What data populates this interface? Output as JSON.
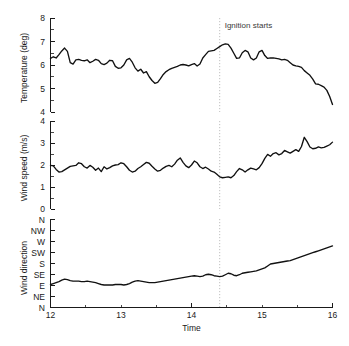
{
  "figure": {
    "annotation": {
      "text": "Ignition starts",
      "x_value": 14.4,
      "color": "#b9b9b9"
    },
    "line_color": "#111111",
    "xlabel": "Time",
    "x_ticks": [
      "12",
      "13",
      "14",
      "15",
      "16"
    ],
    "x_minor_ticks": [
      "12.5",
      "13.5",
      "14.5",
      "15.5"
    ]
  },
  "chart_data": [
    {
      "type": "line",
      "title": "",
      "xlabel": "",
      "ylabel": "Temperature (deg)",
      "xlim": [
        12,
        16
      ],
      "ylim": [
        4,
        8
      ],
      "yticks": [
        4,
        5,
        6,
        7,
        8
      ],
      "ytick_labels": [
        "4",
        "5",
        "6",
        "7",
        "8"
      ],
      "grid": false,
      "legend": "none",
      "annotations": [
        {
          "text": "Ignition starts",
          "x": 14.4
        }
      ],
      "x": [
        12.0,
        12.04,
        12.08,
        12.12,
        12.16,
        12.2,
        12.24,
        12.28,
        12.32,
        12.36,
        12.4,
        12.44,
        12.48,
        12.52,
        12.56,
        12.6,
        12.64,
        12.68,
        12.72,
        12.76,
        12.8,
        12.84,
        12.88,
        12.92,
        12.96,
        13.0,
        13.04,
        13.08,
        13.12,
        13.16,
        13.2,
        13.24,
        13.28,
        13.32,
        13.36,
        13.4,
        13.44,
        13.48,
        13.52,
        13.56,
        13.6,
        13.64,
        13.68,
        13.72,
        13.76,
        13.8,
        13.84,
        13.88,
        13.92,
        13.96,
        14.0,
        14.04,
        14.08,
        14.12,
        14.16,
        14.2,
        14.24,
        14.28,
        14.32,
        14.36,
        14.4,
        14.44,
        14.48,
        14.52,
        14.56,
        14.6,
        14.64,
        14.68,
        14.72,
        14.76,
        14.8,
        14.84,
        14.88,
        14.92,
        14.96,
        15.0,
        15.04,
        15.08,
        15.12,
        15.16,
        15.2,
        15.24,
        15.28,
        15.32,
        15.36,
        15.4,
        15.44,
        15.48,
        15.52,
        15.56,
        15.6,
        15.64,
        15.68,
        15.72,
        15.76,
        15.8,
        15.84,
        15.88,
        15.92,
        15.96,
        16.0
      ],
      "y": [
        6.28,
        6.35,
        6.3,
        6.44,
        6.6,
        6.72,
        6.58,
        6.1,
        6.04,
        6.22,
        6.24,
        6.2,
        6.18,
        6.22,
        6.1,
        6.16,
        6.24,
        6.2,
        6.06,
        6.02,
        6.08,
        6.2,
        6.18,
        5.94,
        5.86,
        5.88,
        6.0,
        6.22,
        6.28,
        6.12,
        5.88,
        5.74,
        5.82,
        5.66,
        5.72,
        5.5,
        5.34,
        5.22,
        5.26,
        5.42,
        5.6,
        5.72,
        5.8,
        5.86,
        5.9,
        5.94,
        6.0,
        6.02,
        6.0,
        5.96,
        6.02,
        6.06,
        5.96,
        6.04,
        6.3,
        6.44,
        6.58,
        6.6,
        6.62,
        6.7,
        6.78,
        6.86,
        6.9,
        6.88,
        6.72,
        6.5,
        6.28,
        6.3,
        6.52,
        6.62,
        6.56,
        6.3,
        6.22,
        6.3,
        6.56,
        6.62,
        6.4,
        6.28,
        6.3,
        6.3,
        6.28,
        6.26,
        6.22,
        6.24,
        6.2,
        6.1,
        6.0,
        5.96,
        5.94,
        5.9,
        5.76,
        5.66,
        5.56,
        5.4,
        5.2,
        5.18,
        5.12,
        5.06,
        4.92,
        4.66,
        4.32
      ]
    },
    {
      "type": "line",
      "title": "",
      "xlabel": "",
      "ylabel": "Wind speed (m/s)",
      "xlim": [
        12,
        16
      ],
      "ylim": [
        0,
        4
      ],
      "yticks": [
        0,
        1,
        2,
        3,
        4
      ],
      "ytick_labels": [
        "0",
        "1",
        "2",
        "3",
        "4"
      ],
      "grid": false,
      "legend": "none",
      "annotations": [
        {
          "text": "Ignition starts",
          "x": 14.4
        }
      ],
      "x": [
        12.0,
        12.04,
        12.08,
        12.12,
        12.16,
        12.2,
        12.24,
        12.28,
        12.32,
        12.36,
        12.4,
        12.44,
        12.48,
        12.52,
        12.56,
        12.6,
        12.64,
        12.68,
        12.72,
        12.76,
        12.8,
        12.84,
        12.88,
        12.92,
        12.96,
        13.0,
        13.04,
        13.08,
        13.12,
        13.16,
        13.2,
        13.24,
        13.28,
        13.32,
        13.36,
        13.4,
        13.44,
        13.48,
        13.52,
        13.56,
        13.6,
        13.64,
        13.68,
        13.72,
        13.76,
        13.8,
        13.84,
        13.88,
        13.92,
        13.96,
        14.0,
        14.04,
        14.08,
        14.12,
        14.16,
        14.2,
        14.24,
        14.28,
        14.32,
        14.36,
        14.4,
        14.44,
        14.48,
        14.52,
        14.56,
        14.6,
        14.64,
        14.68,
        14.72,
        14.76,
        14.8,
        14.84,
        14.88,
        14.92,
        14.96,
        15.0,
        15.04,
        15.08,
        15.12,
        15.16,
        15.2,
        15.24,
        15.28,
        15.32,
        15.36,
        15.4,
        15.44,
        15.48,
        15.52,
        15.56,
        15.6,
        15.64,
        15.68,
        15.72,
        15.76,
        15.8,
        15.84,
        15.88,
        15.92,
        15.96,
        16.0
      ],
      "y": [
        1.98,
        1.96,
        1.8,
        1.68,
        1.7,
        1.78,
        1.86,
        1.94,
        1.96,
        1.98,
        2.1,
        2.06,
        1.92,
        1.86,
        1.98,
        1.9,
        1.76,
        1.86,
        1.7,
        1.92,
        1.82,
        1.88,
        1.96,
        2.0,
        2.02,
        2.1,
        2.06,
        1.92,
        1.76,
        1.68,
        1.72,
        1.84,
        1.92,
        2.02,
        2.12,
        2.08,
        1.94,
        1.82,
        1.72,
        1.76,
        1.86,
        1.94,
        1.98,
        1.92,
        2.04,
        2.22,
        2.32,
        2.12,
        1.96,
        1.88,
        2.0,
        2.18,
        2.1,
        1.92,
        1.84,
        1.9,
        1.82,
        1.72,
        1.68,
        1.58,
        1.46,
        1.42,
        1.44,
        1.46,
        1.42,
        1.52,
        1.7,
        1.84,
        1.78,
        1.68,
        1.78,
        1.86,
        1.82,
        1.78,
        1.88,
        2.06,
        2.3,
        2.48,
        2.4,
        2.52,
        2.56,
        2.46,
        2.52,
        2.66,
        2.6,
        2.54,
        2.62,
        2.7,
        2.62,
        2.84,
        3.26,
        3.06,
        2.82,
        2.74,
        2.76,
        2.82,
        2.78,
        2.8,
        2.86,
        2.92,
        3.04
      ]
    },
    {
      "type": "line",
      "title": "",
      "xlabel": "Time",
      "ylabel": "Wind direction",
      "xlim": [
        12,
        16
      ],
      "ylim": [
        0,
        360
      ],
      "yticks": [
        0,
        45,
        90,
        135,
        180,
        225,
        270,
        315,
        360
      ],
      "ytick_labels": [
        "N",
        "NE",
        "E",
        "SE",
        "S",
        "SW",
        "W",
        "NW",
        "N"
      ],
      "grid": false,
      "legend": "none",
      "annotations": [
        {
          "text": "Ignition starts",
          "x": 14.4
        }
      ],
      "x": [
        12.0,
        12.04,
        12.08,
        12.12,
        12.16,
        12.2,
        12.24,
        12.28,
        12.32,
        12.36,
        12.4,
        12.44,
        12.48,
        12.52,
        12.56,
        12.6,
        12.64,
        12.68,
        12.72,
        12.76,
        12.8,
        12.84,
        12.88,
        12.92,
        12.96,
        13.0,
        13.04,
        13.08,
        13.12,
        13.16,
        13.2,
        13.24,
        13.28,
        13.32,
        13.36,
        13.4,
        13.44,
        13.48,
        13.52,
        13.56,
        13.6,
        13.64,
        13.68,
        13.72,
        13.76,
        13.8,
        13.84,
        13.88,
        13.92,
        13.96,
        14.0,
        14.04,
        14.08,
        14.12,
        14.16,
        14.2,
        14.24,
        14.28,
        14.32,
        14.36,
        14.4,
        14.44,
        14.48,
        14.52,
        14.56,
        14.6,
        14.64,
        14.68,
        14.72,
        14.76,
        14.8,
        14.84,
        14.88,
        14.92,
        14.96,
        15.0,
        15.04,
        15.08,
        15.12,
        15.16,
        15.2,
        15.24,
        15.28,
        15.32,
        15.36,
        15.4,
        15.44,
        15.48,
        15.52,
        15.56,
        15.6,
        15.64,
        15.68,
        15.72,
        15.76,
        15.8,
        15.84,
        15.88,
        15.92,
        15.96,
        16.0
      ],
      "y": [
        92,
        96,
        100,
        104,
        110,
        114,
        112,
        108,
        106,
        106,
        106,
        104,
        104,
        106,
        104,
        102,
        100,
        96,
        92,
        90,
        90,
        90,
        90,
        92,
        92,
        92,
        90,
        92,
        96,
        102,
        106,
        108,
        106,
        104,
        102,
        100,
        100,
        100,
        102,
        104,
        106,
        108,
        110,
        112,
        114,
        116,
        118,
        120,
        122,
        124,
        126,
        128,
        126,
        124,
        126,
        132,
        134,
        132,
        128,
        126,
        124,
        126,
        132,
        138,
        136,
        130,
        128,
        132,
        138,
        140,
        142,
        144,
        146,
        148,
        152,
        156,
        160,
        168,
        176,
        178,
        180,
        182,
        184,
        186,
        188,
        190,
        194,
        198,
        202,
        206,
        210,
        214,
        218,
        222,
        226,
        230,
        234,
        238,
        242,
        246,
        250
      ]
    }
  ]
}
